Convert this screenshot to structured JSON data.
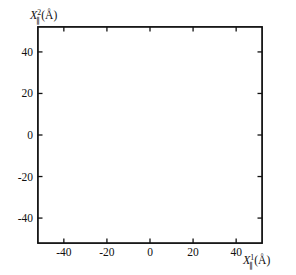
{
  "chart_data": {
    "type": "scatter",
    "title": "",
    "subtitle": "",
    "xlabel": "X∥¹(Å)",
    "ylabel": "X∥²(Å)",
    "xlabel_parts": {
      "base": "X",
      "sub": "∥",
      "sup": "1",
      "unit": "(Å)"
    },
    "ylabel_parts": {
      "base": "X",
      "sub": "∥",
      "sup": "2",
      "unit": "(Å)"
    },
    "xlim": [
      -52,
      52
    ],
    "ylim": [
      -52,
      52
    ],
    "xticks": [
      -40,
      -20,
      0,
      20,
      40
    ],
    "yticks": [
      40,
      20,
      0,
      -20,
      -40
    ],
    "xtick_labels": [
      "-40",
      "-20",
      "0",
      "20",
      "40"
    ],
    "ytick_labels": [
      "40",
      "20",
      "0",
      "-20",
      "-40"
    ],
    "grid": false,
    "legend": null,
    "series": [
      {
        "name": "substrate lattice atoms",
        "marker": "filled-square-dot",
        "marker_size_px": 3.1,
        "color": "#111111",
        "description": "triangular (hexagonal) lattice of small dark dots filling the whole frame, spacing about 4.3 A"
      },
      {
        "name": "adsorbate rings",
        "marker": "open-circle",
        "radius_data_units": 6.0,
        "color": "#111111",
        "description": "open circles; 19 form a close-packed hexagonal cluster centred at the origin, plus 2 isolated circles",
        "points": [
          {
            "x": 0,
            "y": 0,
            "group": "cluster"
          },
          {
            "x": 10.4,
            "y": 0,
            "group": "cluster"
          },
          {
            "x": 5.2,
            "y": 9.0,
            "group": "cluster"
          },
          {
            "x": -5.2,
            "y": 9.0,
            "group": "cluster"
          },
          {
            "x": -10.4,
            "y": 0,
            "group": "cluster"
          },
          {
            "x": -5.2,
            "y": -9.0,
            "group": "cluster"
          },
          {
            "x": 5.2,
            "y": -9.0,
            "group": "cluster"
          },
          {
            "x": 20.8,
            "y": 0,
            "group": "cluster"
          },
          {
            "x": 15.6,
            "y": 9.0,
            "group": "cluster"
          },
          {
            "x": 10.4,
            "y": 18.0,
            "group": "cluster"
          },
          {
            "x": 0,
            "y": 18.0,
            "group": "cluster"
          },
          {
            "x": -10.4,
            "y": 18.0,
            "group": "cluster"
          },
          {
            "x": -15.6,
            "y": 9.0,
            "group": "cluster"
          },
          {
            "x": -20.8,
            "y": 0,
            "group": "cluster"
          },
          {
            "x": -15.6,
            "y": -9.0,
            "group": "cluster"
          },
          {
            "x": -10.4,
            "y": -18.0,
            "group": "cluster"
          },
          {
            "x": 0,
            "y": -18.0,
            "group": "cluster"
          },
          {
            "x": 10.4,
            "y": -18.0,
            "group": "cluster"
          },
          {
            "x": 15.6,
            "y": -9.0,
            "group": "cluster"
          },
          {
            "x": -39.0,
            "y": 32.0,
            "group": "isolated"
          },
          {
            "x": 38.0,
            "y": -25.0,
            "group": "isolated"
          }
        ]
      }
    ],
    "lattice": {
      "spacing_x": 4.35,
      "spacing_y": 3.77,
      "type": "triangular"
    }
  }
}
